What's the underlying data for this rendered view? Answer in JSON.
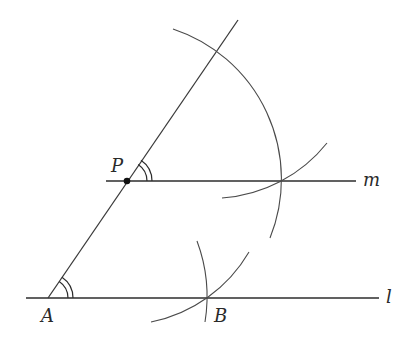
{
  "figure": {
    "type": "geometric-construction"
  },
  "labels": {
    "A": "A",
    "B": "B",
    "P": "P",
    "m": "m",
    "l": "l"
  },
  "points": {
    "A": [
      48,
      298
    ],
    "B": [
      207,
      298
    ],
    "P": [
      127,
      181
    ]
  },
  "lines": {
    "l": {
      "from": [
        26,
        298
      ],
      "to": [
        379,
        298
      ]
    },
    "m": {
      "from": [
        106,
        181
      ],
      "to": [
        356,
        181
      ]
    },
    "transversal": {
      "from": [
        48,
        298
      ],
      "to": [
        238,
        20
      ]
    }
  },
  "colors": {
    "stroke": "#3a3a3a",
    "text": "#2a2a2a",
    "background": "#ffffff"
  }
}
